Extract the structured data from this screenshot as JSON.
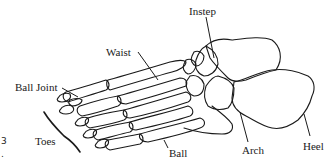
{
  "diagram": {
    "labels": {
      "instep": "Instep",
      "waist": "Waist",
      "ball_joint": "Ball Joint",
      "toes": "Toes",
      "ball": "Ball",
      "arch": "Arch",
      "heel": "Heel"
    },
    "edge_marks": {
      "number": "3",
      "dot": "."
    },
    "colors": {
      "line": "#1a1a1a",
      "background": "#ffffff"
    }
  }
}
